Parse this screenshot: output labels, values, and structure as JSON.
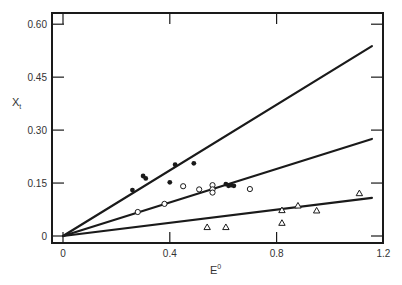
{
  "chart_data": {
    "type": "scatter",
    "title": "",
    "xlabel": "E",
    "xlabel_superscript": "0",
    "ylabel": "X",
    "ylabel_subscript": "t",
    "xlim": [
      0,
      1.2
    ],
    "ylim": [
      0,
      0.6
    ],
    "x_ticks": [
      0,
      0.4,
      0.8,
      1.2
    ],
    "x_tick_labels": [
      "0",
      "0.4",
      "0.8",
      "1.2"
    ],
    "y_ticks": [
      0,
      0.15,
      0.3,
      0.45,
      0.6
    ],
    "y_tick_labels": [
      "0",
      "0.15",
      "0.30",
      "0.45",
      "0.60"
    ],
    "grid": false,
    "legend": null,
    "series": [
      {
        "name": "filled circles",
        "marker": "filled-circle",
        "points": [
          [
            0.26,
            0.13
          ],
          [
            0.3,
            0.17
          ],
          [
            0.31,
            0.163
          ],
          [
            0.4,
            0.152
          ],
          [
            0.42,
            0.202
          ],
          [
            0.49,
            0.206
          ],
          [
            0.61,
            0.147
          ],
          [
            0.62,
            0.142
          ],
          [
            0.63,
            0.144
          ],
          [
            0.64,
            0.142
          ]
        ],
        "fit_line": {
          "x": [
            0,
            1.157
          ],
          "y": [
            0,
            0.538
          ],
          "slope": 0.465
        }
      },
      {
        "name": "open circles",
        "marker": "open-circle",
        "points": [
          [
            0.28,
            0.068
          ],
          [
            0.38,
            0.091
          ],
          [
            0.45,
            0.141
          ],
          [
            0.51,
            0.132
          ],
          [
            0.56,
            0.144
          ],
          [
            0.56,
            0.132
          ],
          [
            0.56,
            0.123
          ],
          [
            0.7,
            0.133
          ]
        ],
        "fit_line": {
          "x": [
            0,
            1.157
          ],
          "y": [
            0,
            0.275
          ],
          "slope": 0.238
        }
      },
      {
        "name": "open triangles",
        "marker": "open-triangle",
        "points": [
          [
            0.54,
            0.025
          ],
          [
            0.61,
            0.025
          ],
          [
            0.82,
            0.073
          ],
          [
            0.82,
            0.037
          ],
          [
            0.88,
            0.086
          ],
          [
            0.95,
            0.072
          ],
          [
            1.11,
            0.121
          ]
        ],
        "fit_line": {
          "x": [
            0,
            1.157
          ],
          "y": [
            0,
            0.108
          ],
          "slope": 0.093
        }
      }
    ]
  },
  "colors": {
    "ink": "#1a1a1a",
    "background": "#ffffff"
  }
}
